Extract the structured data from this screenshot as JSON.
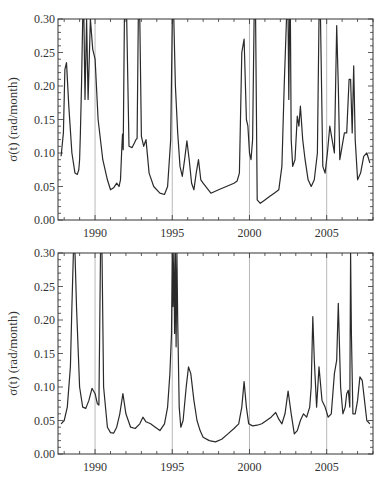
{
  "chart_data": [
    {
      "type": "line",
      "title": "",
      "xlabel": "",
      "ylabel": "σ(t) (rad/month)",
      "xlim": [
        1987.6,
        2008.0
      ],
      "ylim": [
        0.0,
        0.3
      ],
      "x_ticks": [
        1990,
        1995,
        2000,
        2005
      ],
      "x_tick_labels": [
        "1990",
        "1995",
        "2000",
        "2005"
      ],
      "y_ticks": [
        0.0,
        0.05,
        0.1,
        0.15,
        0.2,
        0.25,
        0.3
      ],
      "y_tick_labels": [
        "0.00",
        "0.05",
        "0.10",
        "0.15",
        "0.20",
        "0.25",
        "0.30"
      ],
      "vertical_gridlines": [
        1990,
        1995,
        2000,
        2005
      ],
      "grid": false,
      "legend": null,
      "series": [
        {
          "name": "sigma_top",
          "x": [
            1987.8,
            1987.95,
            1988.05,
            1988.15,
            1988.3,
            1988.5,
            1988.7,
            1988.85,
            1988.95,
            1989.0,
            1989.05,
            1989.12,
            1989.2,
            1989.28,
            1989.35,
            1989.45,
            1989.55,
            1989.7,
            1989.85,
            1990.0,
            1990.2,
            1990.5,
            1990.8,
            1991.0,
            1991.2,
            1991.4,
            1991.55,
            1991.65,
            1991.72,
            1991.78,
            1991.82,
            1991.9,
            1992.05,
            1992.2,
            1992.4,
            1992.55,
            1992.65,
            1992.72,
            1992.8,
            1992.9,
            1993.0,
            1993.15,
            1993.3,
            1993.5,
            1993.8,
            1994.2,
            1994.5,
            1994.7,
            1994.9,
            1995.0,
            1995.1,
            1995.2,
            1995.35,
            1995.5,
            1995.65,
            1995.8,
            1995.95,
            1996.1,
            1996.25,
            1996.4,
            1996.55,
            1996.7,
            1996.85,
            1997.0,
            1997.5,
            1998.0,
            1998.5,
            1999.0,
            1999.2,
            1999.35,
            1999.5,
            1999.65,
            1999.8,
            1999.9,
            2000.0,
            2000.1,
            2000.2,
            2000.3,
            2000.4,
            2000.5,
            2000.7,
            2001.0,
            2001.3,
            2001.6,
            2001.9,
            2002.1,
            2002.25,
            2002.4,
            2002.5,
            2002.55,
            2002.6,
            2002.65,
            2002.7,
            2002.8,
            2002.95,
            2003.1,
            2003.2,
            2003.3,
            2003.45,
            2003.6,
            2003.8,
            2004.0,
            2004.2,
            2004.4,
            2004.5,
            2004.6,
            2004.75,
            2004.9,
            2005.05,
            2005.2,
            2005.35,
            2005.5,
            2005.65,
            2005.75,
            2005.85,
            2006.0,
            2006.15,
            2006.3,
            2006.45,
            2006.55,
            2006.65,
            2006.75,
            2006.85,
            2007.0,
            2007.2,
            2007.4,
            2007.6,
            2007.8
          ],
          "values": [
            0.095,
            0.13,
            0.225,
            0.235,
            0.17,
            0.1,
            0.07,
            0.068,
            0.075,
            0.09,
            0.13,
            0.2,
            0.3,
            0.3,
            0.18,
            0.3,
            0.18,
            0.3,
            0.255,
            0.24,
            0.15,
            0.09,
            0.06,
            0.045,
            0.048,
            0.055,
            0.05,
            0.06,
            0.1,
            0.128,
            0.105,
            0.3,
            0.3,
            0.11,
            0.108,
            0.115,
            0.12,
            0.122,
            0.3,
            0.3,
            0.125,
            0.11,
            0.12,
            0.07,
            0.05,
            0.04,
            0.038,
            0.05,
            0.12,
            0.3,
            0.3,
            0.2,
            0.13,
            0.08,
            0.065,
            0.09,
            0.118,
            0.09,
            0.055,
            0.045,
            0.07,
            0.09,
            0.06,
            0.055,
            0.04,
            0.045,
            0.05,
            0.055,
            0.058,
            0.07,
            0.25,
            0.27,
            0.15,
            0.14,
            0.1,
            0.09,
            0.12,
            0.3,
            0.3,
            0.03,
            0.025,
            0.03,
            0.035,
            0.04,
            0.045,
            0.08,
            0.2,
            0.3,
            0.3,
            0.18,
            0.3,
            0.3,
            0.12,
            0.08,
            0.09,
            0.155,
            0.14,
            0.17,
            0.12,
            0.09,
            0.06,
            0.05,
            0.06,
            0.1,
            0.3,
            0.3,
            0.08,
            0.07,
            0.1,
            0.14,
            0.12,
            0.1,
            0.29,
            0.2,
            0.09,
            0.11,
            0.13,
            0.13,
            0.21,
            0.21,
            0.13,
            0.23,
            0.12,
            0.06,
            0.07,
            0.095,
            0.1,
            0.085
          ]
        }
      ]
    },
    {
      "type": "line",
      "title": "",
      "xlabel": "",
      "ylabel": "σ(t) (rad/month)",
      "xlim": [
        1987.6,
        2008.0
      ],
      "ylim": [
        0.0,
        0.3
      ],
      "x_ticks": [
        1990,
        1995,
        2000,
        2005
      ],
      "x_tick_labels": [
        "1990",
        "1995",
        "2000",
        "2005"
      ],
      "y_ticks": [
        0.0,
        0.05,
        0.1,
        0.15,
        0.2,
        0.25,
        0.3
      ],
      "y_tick_labels": [
        "0.00",
        "0.05",
        "0.10",
        "0.15",
        "0.20",
        "0.25",
        "0.30"
      ],
      "vertical_gridlines": [
        1990,
        1995,
        2000,
        2005
      ],
      "grid": false,
      "legend": null,
      "series": [
        {
          "name": "sigma_bottom",
          "x": [
            1987.8,
            1988.0,
            1988.2,
            1988.4,
            1988.5,
            1988.6,
            1988.7,
            1988.8,
            1989.0,
            1989.2,
            1989.4,
            1989.6,
            1989.8,
            1990.0,
            1990.15,
            1990.25,
            1990.35,
            1990.45,
            1990.55,
            1990.8,
            1991.0,
            1991.2,
            1991.4,
            1991.6,
            1991.8,
            1992.0,
            1992.3,
            1992.6,
            1992.9,
            1993.1,
            1993.3,
            1993.6,
            1993.9,
            1994.2,
            1994.5,
            1994.7,
            1994.85,
            1994.95,
            1995.0,
            1995.05,
            1995.1,
            1995.15,
            1995.2,
            1995.25,
            1995.3,
            1995.35,
            1995.45,
            1995.55,
            1995.7,
            1995.9,
            1996.05,
            1996.2,
            1996.4,
            1996.6,
            1996.8,
            1997.0,
            1997.4,
            1997.8,
            1998.2,
            1998.6,
            1999.0,
            1999.3,
            1999.5,
            1999.65,
            1999.8,
            1999.95,
            2000.2,
            2000.5,
            2000.8,
            2001.1,
            2001.4,
            2001.7,
            2001.9,
            2002.1,
            2002.3,
            2002.5,
            2002.7,
            2002.9,
            2003.1,
            2003.3,
            2003.5,
            2003.7,
            2003.9,
            2004.0,
            2004.1,
            2004.2,
            2004.35,
            2004.5,
            2004.7,
            2004.9,
            2005.1,
            2005.3,
            2005.5,
            2005.65,
            2005.75,
            2005.9,
            2006.05,
            2006.2,
            2006.3,
            2006.4,
            2006.5,
            2006.55,
            2006.6,
            2006.7,
            2006.85,
            2007.0,
            2007.15,
            2007.3,
            2007.45,
            2007.6,
            2007.8
          ],
          "values": [
            0.045,
            0.05,
            0.07,
            0.13,
            0.22,
            0.3,
            0.3,
            0.22,
            0.1,
            0.07,
            0.068,
            0.08,
            0.098,
            0.09,
            0.075,
            0.073,
            0.3,
            0.3,
            0.1,
            0.04,
            0.032,
            0.031,
            0.04,
            0.06,
            0.09,
            0.06,
            0.04,
            0.038,
            0.045,
            0.055,
            0.048,
            0.045,
            0.04,
            0.035,
            0.045,
            0.07,
            0.12,
            0.18,
            0.3,
            0.22,
            0.3,
            0.18,
            0.3,
            0.16,
            0.3,
            0.2,
            0.07,
            0.04,
            0.05,
            0.1,
            0.13,
            0.12,
            0.08,
            0.05,
            0.035,
            0.025,
            0.02,
            0.018,
            0.022,
            0.03,
            0.038,
            0.045,
            0.07,
            0.108,
            0.07,
            0.045,
            0.042,
            0.043,
            0.045,
            0.05,
            0.055,
            0.062,
            0.052,
            0.045,
            0.06,
            0.094,
            0.06,
            0.03,
            0.035,
            0.05,
            0.06,
            0.055,
            0.07,
            0.1,
            0.205,
            0.14,
            0.07,
            0.13,
            0.08,
            0.07,
            0.055,
            0.06,
            0.12,
            0.14,
            0.225,
            0.1,
            0.06,
            0.07,
            0.09,
            0.095,
            0.07,
            0.3,
            0.18,
            0.06,
            0.06,
            0.08,
            0.115,
            0.11,
            0.08,
            0.05,
            0.045
          ]
        }
      ]
    }
  ],
  "panels": {
    "top": {
      "ylabel": "σ(t) (rad/month)"
    },
    "bottom": {
      "ylabel": "σ(t) (rad/month)"
    }
  },
  "colors": {
    "line": "#2a2a2a",
    "gridline": "#b8b8b8",
    "axis": "#333333"
  }
}
